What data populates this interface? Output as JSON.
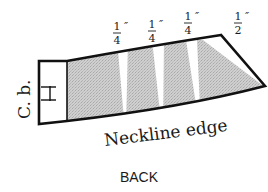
{
  "diagram": {
    "title": "BACK",
    "edge_label": "Neckline edge",
    "center_back_label": "C. b.",
    "fold_mark": "center-back-fold-icon",
    "slash_spreads": [
      {
        "numerator": "1",
        "denominator": "4",
        "unit": "″"
      },
      {
        "numerator": "1",
        "denominator": "4",
        "unit": "″"
      },
      {
        "numerator": "1",
        "denominator": "4",
        "unit": "″"
      },
      {
        "numerator": "1",
        "denominator": "2",
        "unit": "″"
      }
    ],
    "colors": {
      "outline": "#111111",
      "fill": "#c9c9c9",
      "background": "#ffffff"
    }
  }
}
